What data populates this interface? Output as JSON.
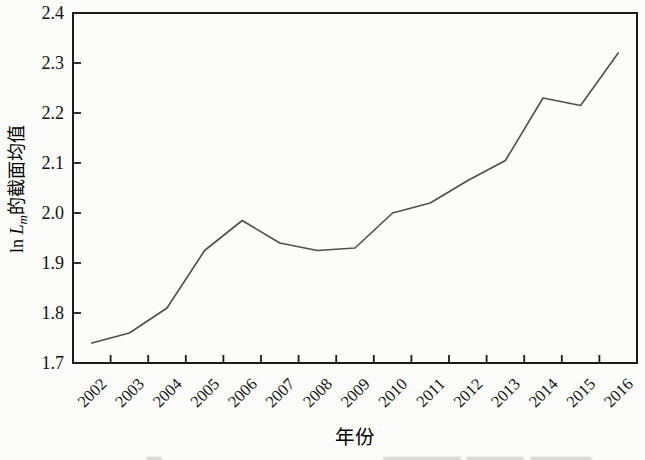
{
  "figure": {
    "background_color": "#fcfcfa"
  },
  "chart_data": {
    "type": "line",
    "title": "",
    "xlabel": "年份",
    "ylabel": "ln Lm的截面均值",
    "ylabel_parts": [
      {
        "text": "ln ",
        "style": "normal"
      },
      {
        "text": "L",
        "style": "italic"
      },
      {
        "text": "m",
        "style": "italic-sub"
      },
      {
        "text": "的截面均值",
        "style": "normal"
      }
    ],
    "x": [
      2002,
      2003,
      2004,
      2005,
      2006,
      2007,
      2008,
      2009,
      2010,
      2011,
      2012,
      2013,
      2014,
      2015,
      2016
    ],
    "values": [
      1.74,
      1.76,
      1.81,
      1.925,
      1.985,
      1.94,
      1.925,
      1.93,
      2.0,
      2.02,
      2.065,
      2.105,
      2.23,
      2.215,
      2.32
    ],
    "ylim": [
      1.7,
      2.4
    ],
    "yticks": [
      1.7,
      1.8,
      1.9,
      2.0,
      2.1,
      2.2,
      2.3,
      2.4
    ],
    "ytick_format_decimals": 1,
    "xlim": [
      2001.5,
      2016.5
    ],
    "xticks_at_half_years": true,
    "grid": false,
    "legend": "none",
    "line_color": "#4f4f4f",
    "frame_color": "#1c1c1c",
    "tick_label_color": "#121212"
  }
}
